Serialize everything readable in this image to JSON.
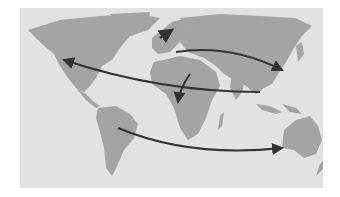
{
  "map": {
    "title": "",
    "style": "grayscale world map",
    "colors": {
      "background": "#ffffff",
      "ocean": "#e2e2e2",
      "land": "#a4a4a4",
      "arrow": "#333333"
    },
    "arrows": [
      {
        "name": "europe-to-east-asia",
        "from": "Europe",
        "to": "China"
      },
      {
        "name": "europe-to-north-america",
        "from": "Africa/Asia",
        "to": "North America"
      },
      {
        "name": "middle-east-to-africa",
        "from": "Middle East",
        "to": "Central Africa"
      },
      {
        "name": "south-america-to-australia",
        "from": "South America",
        "to": "Australia"
      },
      {
        "name": "scandinavia-to-north",
        "from": "Northern Europe",
        "to": "Arctic"
      }
    ]
  }
}
